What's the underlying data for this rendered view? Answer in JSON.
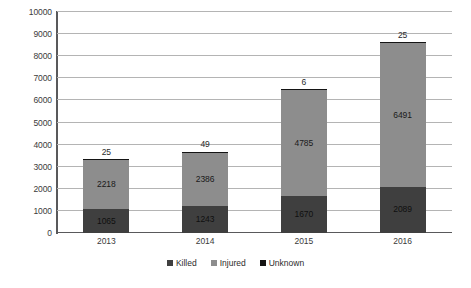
{
  "chart_data": {
    "type": "bar",
    "subtype": "stacked-bar",
    "title": "",
    "subtitle": "",
    "xlabel": "",
    "ylabel": "",
    "categories": [
      "2013",
      "2014",
      "2015",
      "2016"
    ],
    "series": [
      {
        "name": "Killed",
        "color": "#3f3f3f",
        "values": [
          1065,
          1243,
          1670,
          2089
        ]
      },
      {
        "name": "Injured",
        "color": "#8d8d8d",
        "values": [
          2218,
          2386,
          4785,
          6491
        ]
      },
      {
        "name": "Unknown",
        "color": "#141414",
        "values": [
          25,
          49,
          6,
          25
        ]
      }
    ],
    "totals": [
      3308,
      3678,
      6461,
      8605
    ],
    "ylim": [
      0,
      10000
    ],
    "ytick_step": 1000,
    "yticks": [
      "10000",
      "9000",
      "8000",
      "7000",
      "6000",
      "5000",
      "4000",
      "3000",
      "2000",
      "1000",
      "0"
    ],
    "grid": "horizontal",
    "legend_position": "bottom-center",
    "data_labels": {
      "2013": {
        "killed": "1065",
        "injured": "2218",
        "unknown": "25"
      },
      "2014": {
        "killed": "1243",
        "injured": "2386",
        "unknown": "49"
      },
      "2015": {
        "killed": "1670",
        "injured": "4785",
        "unknown": "6"
      },
      "2016": {
        "killed": "2089",
        "injured": "6491",
        "unknown": "25"
      }
    },
    "background_color": "#ffffff",
    "gridline_color": "#b4b4b4",
    "axis_color": "#59595b"
  },
  "legend": {
    "items": [
      {
        "label": "Killed",
        "color": "#3f3f3f"
      },
      {
        "label": "Injured",
        "color": "#8d8d8d"
      },
      {
        "label": "Unknown",
        "color": "#141414"
      }
    ]
  }
}
